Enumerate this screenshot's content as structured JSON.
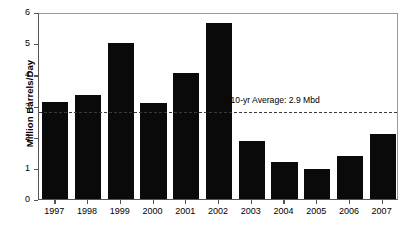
{
  "chart_data": {
    "type": "bar",
    "title": "",
    "xlabel": "",
    "ylabel": "Million Barrels/Day",
    "categories": [
      "1997",
      "1998",
      "1999",
      "2000",
      "2001",
      "2002",
      "2003",
      "2004",
      "2005",
      "2006",
      "2007"
    ],
    "values": [
      3.1,
      3.35,
      5.0,
      3.07,
      4.05,
      5.65,
      1.85,
      1.2,
      0.95,
      1.38,
      2.1
    ],
    "ylim": [
      0,
      6
    ],
    "ytick_labels": [
      "0",
      "1",
      "2",
      "3",
      "4",
      "5",
      "6"
    ],
    "ytick_values": [
      0,
      1,
      2,
      3,
      4,
      5,
      6
    ],
    "grid": false,
    "legend": "none",
    "bar_color": "#0a0a0a",
    "annotations": [
      {
        "name": "ten-year-average",
        "label": "10-yr Average: 2.9 Mbd",
        "value": 2.85,
        "style": "dashed-horizontal-line",
        "color": "#3a3a3a"
      }
    ]
  }
}
